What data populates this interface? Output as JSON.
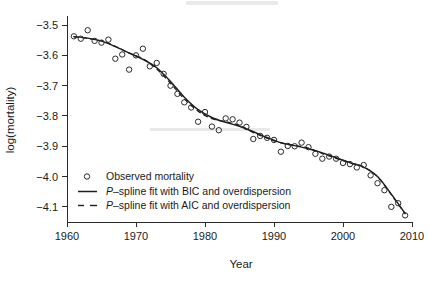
{
  "chart_data": {
    "type": "scatter",
    "title": "",
    "xlabel": "Year",
    "ylabel": "log(mortality)",
    "xlim": [
      1960,
      2010
    ],
    "ylim": [
      -4.15,
      -3.47
    ],
    "xticks": [
      1960,
      1970,
      1980,
      1990,
      2000,
      2010
    ],
    "xtick_labels": [
      "1960",
      "1970",
      "1980",
      "1990",
      "2000",
      "2010"
    ],
    "yticks": [
      -3.5,
      -3.6,
      -3.7,
      -3.8,
      -3.9,
      -4.0,
      -4.1
    ],
    "ytick_labels": [
      "-3.5",
      "-3.6",
      "-3.7",
      "-3.8",
      "-3.9",
      "-4.0",
      "-4.1"
    ],
    "grid": false,
    "legend_position": "lower-left-inside",
    "legend": [
      {
        "label": "Observed mortality",
        "marker": "open-circle",
        "style": "none"
      },
      {
        "label": "P-spline fit with BIC and overdispersion",
        "marker": "none",
        "style": "solid"
      },
      {
        "label": "P-spline fit with AIC and overdispersion",
        "marker": "none",
        "style": "dashed"
      }
    ],
    "series": [
      {
        "name": "Observed mortality",
        "marker": "open-circle",
        "x": [
          1961,
          1962,
          1963,
          1964,
          1965,
          1966,
          1967,
          1968,
          1969,
          1970,
          1971,
          1972,
          1973,
          1974,
          1975,
          1976,
          1977,
          1978,
          1979,
          1980,
          1981,
          1982,
          1983,
          1984,
          1985,
          1986,
          1987,
          1988,
          1989,
          1990,
          1991,
          1992,
          1993,
          1994,
          1995,
          1996,
          1997,
          1998,
          1999,
          2000,
          2001,
          2002,
          2003,
          2004,
          2005,
          2006,
          2007,
          2008,
          2009
        ],
        "y": [
          -3.537,
          -3.545,
          -3.517,
          -3.552,
          -3.558,
          -3.548,
          -3.611,
          -3.597,
          -3.647,
          -3.6,
          -3.578,
          -3.636,
          -3.625,
          -3.661,
          -3.7,
          -3.727,
          -3.755,
          -3.772,
          -3.819,
          -3.787,
          -3.835,
          -3.847,
          -3.808,
          -3.811,
          -3.822,
          -3.836,
          -3.876,
          -3.866,
          -3.872,
          -3.879,
          -3.918,
          -3.899,
          -3.9,
          -3.888,
          -3.903,
          -3.925,
          -3.941,
          -3.934,
          -3.941,
          -3.955,
          -3.959,
          -3.97,
          -3.962,
          -3.996,
          -4.022,
          -4.045,
          -4.1,
          -4.088,
          -4.128
        ]
      },
      {
        "name": "P-spline fit with BIC and overdispersion",
        "style": "solid",
        "x": [
          1961,
          1963,
          1965,
          1967,
          1969,
          1971,
          1973,
          1975,
          1977,
          1979,
          1981,
          1983,
          1985,
          1987,
          1989,
          1991,
          1993,
          1995,
          1997,
          1999,
          2001,
          2003,
          2005,
          2007,
          2009
        ],
        "y": [
          -3.538,
          -3.543,
          -3.553,
          -3.571,
          -3.592,
          -3.613,
          -3.641,
          -3.686,
          -3.738,
          -3.779,
          -3.805,
          -3.821,
          -3.834,
          -3.852,
          -3.871,
          -3.888,
          -3.898,
          -3.908,
          -3.922,
          -3.938,
          -3.954,
          -3.969,
          -4.0,
          -4.058,
          -4.122
        ]
      },
      {
        "name": "P-spline fit with AIC and overdispersion",
        "style": "dashed",
        "x": [
          1961,
          1963,
          1965,
          1967,
          1969,
          1971,
          1973,
          1975,
          1977,
          1979,
          1981,
          1983,
          1985,
          1987,
          1989,
          1991,
          1993,
          1995,
          1997,
          1999,
          2001,
          2003,
          2005,
          2007,
          2009
        ],
        "y": [
          -3.539,
          -3.544,
          -3.552,
          -3.57,
          -3.593,
          -3.611,
          -3.645,
          -3.692,
          -3.744,
          -3.784,
          -3.809,
          -3.819,
          -3.831,
          -3.855,
          -3.873,
          -3.889,
          -3.897,
          -3.906,
          -3.924,
          -3.94,
          -3.955,
          -3.968,
          -4.001,
          -4.06,
          -4.123
        ]
      }
    ]
  }
}
